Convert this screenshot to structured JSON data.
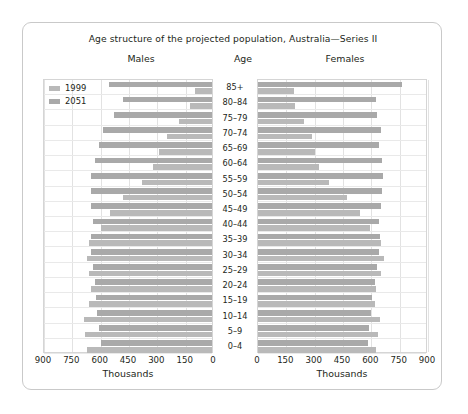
{
  "chart_data": {
    "type": "bar",
    "title": "Age structure of the projected population, Australia—Series II",
    "subtype": "population-pyramid",
    "panels": [
      {
        "name": "Males",
        "xlabel": "Thousands",
        "reversed": true
      },
      {
        "name": "Females",
        "xlabel": "Thousands",
        "reversed": false
      }
    ],
    "age_header": "Age",
    "categories": [
      "85+",
      "80–84",
      "75–79",
      "70–74",
      "65–69",
      "60–64",
      "55–59",
      "50–54",
      "45–49",
      "40–44",
      "35–39",
      "30–34",
      "25–29",
      "20–24",
      "15–19",
      "10–14",
      "5–9",
      "0–4"
    ],
    "xticks": [
      0,
      150,
      300,
      450,
      600,
      750,
      900
    ],
    "xlim": [
      0,
      900
    ],
    "ylabel": "Age",
    "grid": true,
    "legend": [
      "1999",
      "2051"
    ],
    "legend_position": "top-left",
    "series": [
      {
        "name": "1999",
        "panel": "Males",
        "values": [
          90,
          115,
          175,
          240,
          280,
          315,
          370,
          470,
          540,
          590,
          650,
          660,
          650,
          640,
          650,
          680,
          670,
          660
        ]
      },
      {
        "name": "2051",
        "panel": "Males",
        "values": [
          545,
          470,
          520,
          575,
          600,
          620,
          640,
          640,
          640,
          630,
          640,
          640,
          630,
          620,
          615,
          610,
          600,
          590
        ]
      },
      {
        "name": "1999",
        "panel": "Females",
        "values": [
          190,
          195,
          245,
          285,
          300,
          325,
          375,
          470,
          540,
          595,
          650,
          665,
          650,
          625,
          620,
          645,
          635,
          625
        ]
      },
      {
        "name": "2051",
        "panel": "Females",
        "values": [
          760,
          625,
          630,
          650,
          640,
          655,
          660,
          655,
          650,
          640,
          645,
          640,
          630,
          620,
          605,
          600,
          590,
          580
        ]
      }
    ],
    "colors": {
      "1999": "#b9b9b9",
      "2051": "#a9a9a9",
      "grid": "#e2e2e2",
      "frame": "#c9c9c9"
    }
  }
}
